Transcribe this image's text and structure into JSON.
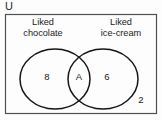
{
  "figure": {
    "type": "venn-diagram",
    "universe_label": "U",
    "sets": [
      {
        "id": "left",
        "label_line1": "Liked",
        "label_line2": "chocolate",
        "region_value": "8"
      },
      {
        "id": "right",
        "label_line1": "Liked",
        "label_line2": "ice-cream",
        "region_value": "6"
      }
    ],
    "intersection_value": "A",
    "outside_value": "2",
    "colors": {
      "stroke": "#1a1a1a",
      "text": "#222222",
      "background": "#fdfdfd",
      "box_border": "#555555"
    }
  },
  "labels": {
    "left_title_line1": "Liked",
    "left_title_line2": "chocolate",
    "right_title_line1": "Liked",
    "right_title_line2": "ice-cream",
    "universe": "U",
    "left_only_count": "8",
    "intersection_count": "A",
    "right_only_count": "6",
    "outside_count": "2"
  }
}
